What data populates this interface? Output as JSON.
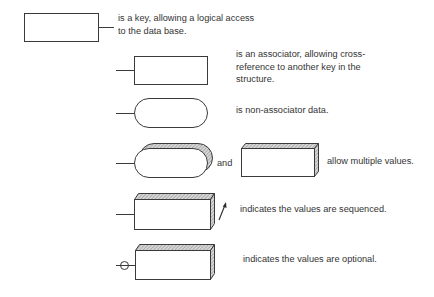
{
  "legend": {
    "key": {
      "symbol": "rectangle-with-right-line",
      "lines": [
        "is a key, allowing a logical access",
        "to the data base."
      ]
    },
    "associator": {
      "symbol": "rectangle-with-left-line",
      "lines": [
        "is an associator, allowing cross-",
        "reference to another key in the",
        "structure."
      ]
    },
    "non_associator": {
      "symbol": "rounded-oval-with-left-line",
      "lines": [
        "is non-associator data."
      ]
    },
    "multiple_values": {
      "symbol_1": "stacked-oval",
      "conjunction": "and",
      "symbol_2": "3d-box",
      "lines": [
        "allow multiple values."
      ]
    },
    "sequenced": {
      "symbol": "3d-box-with-arrow",
      "lines": [
        "indicates the values are sequenced."
      ]
    },
    "optional": {
      "symbol": "3d-box-with-circle-on-line",
      "lines": [
        "indicates the values are optional."
      ]
    }
  },
  "colors": {
    "stroke": "#3a3a3a",
    "text": "#333333",
    "hatch": "#9a9a9a",
    "background": "#ffffff"
  }
}
